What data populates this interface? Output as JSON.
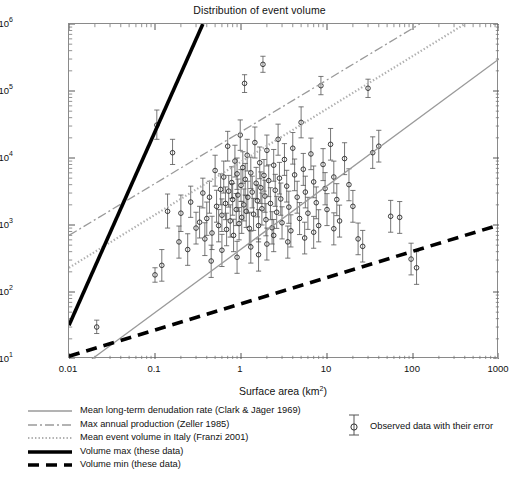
{
  "chart_data": {
    "type": "scatter",
    "title": "Distribution of event volume",
    "xlabel": "Surface area (km²)",
    "ylabel": "Event volume (m³)",
    "xscale": "log",
    "yscale": "log",
    "xlim": [
      0.01,
      1000
    ],
    "ylim": [
      10,
      1000000
    ],
    "grid": false,
    "xticks": [
      "0.01",
      "0.1",
      "1",
      "10",
      "100",
      "1000"
    ],
    "yticks": [
      "10^1",
      "10^2",
      "10^3",
      "10^4",
      "10^5",
      "10^6"
    ],
    "ytick_labels": [
      "10",
      "10",
      "10",
      "10",
      "10",
      "10"
    ],
    "ytick_exponents": [
      "1",
      "2",
      "3",
      "4",
      "5",
      "6"
    ],
    "legend_position": "below-axes",
    "series": [
      {
        "name": "Observed data with their error",
        "type": "scatter-errorbar",
        "marker": "open-circle",
        "color": "#303030",
        "points": [
          {
            "x": 0.021,
            "y": 30,
            "elo": 24,
            "ehi": 38
          },
          {
            "x": 0.1,
            "y": 180,
            "elo": 140,
            "ehi": 230
          },
          {
            "x": 0.105,
            "y": 31000,
            "elo": 19000,
            "ehi": 52000
          },
          {
            "x": 0.14,
            "y": 1600,
            "elo": 900,
            "ehi": 2900
          },
          {
            "x": 0.16,
            "y": 12000,
            "elo": 8000,
            "ehi": 19000
          },
          {
            "x": 0.2,
            "y": 1500,
            "elo": 800,
            "ehi": 2800
          },
          {
            "x": 0.26,
            "y": 2200,
            "elo": 1300,
            "ehi": 3800
          },
          {
            "x": 0.3,
            "y": 900,
            "elo": 520,
            "ehi": 1550
          },
          {
            "x": 0.33,
            "y": 1100,
            "elo": 640,
            "ehi": 1900
          },
          {
            "x": 0.36,
            "y": 3000,
            "elo": 1800,
            "ehi": 5000
          },
          {
            "x": 0.4,
            "y": 1250,
            "elo": 700,
            "ehi": 2200
          },
          {
            "x": 0.43,
            "y": 2600,
            "elo": 1500,
            "ehi": 4500
          },
          {
            "x": 0.46,
            "y": 760,
            "elo": 430,
            "ehi": 1350
          },
          {
            "x": 0.5,
            "y": 6500,
            "elo": 3800,
            "ehi": 11000
          },
          {
            "x": 0.52,
            "y": 1900,
            "elo": 1100,
            "ehi": 3300
          },
          {
            "x": 0.55,
            "y": 980,
            "elo": 560,
            "ehi": 1700
          },
          {
            "x": 0.58,
            "y": 3400,
            "elo": 2000,
            "ehi": 5800
          },
          {
            "x": 0.6,
            "y": 1400,
            "elo": 800,
            "ehi": 2450
          },
          {
            "x": 0.63,
            "y": 5200,
            "elo": 3000,
            "ehi": 9000
          },
          {
            "x": 0.66,
            "y": 2100,
            "elo": 1200,
            "ehi": 3700
          },
          {
            "x": 0.68,
            "y": 860,
            "elo": 490,
            "ehi": 1500
          },
          {
            "x": 0.7,
            "y": 15000,
            "elo": 9000,
            "ehi": 25000
          },
          {
            "x": 0.72,
            "y": 3200,
            "elo": 1850,
            "ehi": 5500
          },
          {
            "x": 0.75,
            "y": 1150,
            "elo": 660,
            "ehi": 2000
          },
          {
            "x": 0.78,
            "y": 4300,
            "elo": 2500,
            "ehi": 7400
          },
          {
            "x": 0.8,
            "y": 2400,
            "elo": 1400,
            "ehi": 4150
          },
          {
            "x": 0.82,
            "y": 700,
            "elo": 400,
            "ehi": 1220
          },
          {
            "x": 0.85,
            "y": 9000,
            "elo": 5200,
            "ehi": 15500
          },
          {
            "x": 0.88,
            "y": 1700,
            "elo": 980,
            "ehi": 2950
          },
          {
            "x": 0.9,
            "y": 5800,
            "elo": 3400,
            "ehi": 10000
          },
          {
            "x": 0.92,
            "y": 2800,
            "elo": 1600,
            "ehi": 4850
          },
          {
            "x": 0.95,
            "y": 1050,
            "elo": 600,
            "ehi": 1820
          },
          {
            "x": 0.98,
            "y": 22000,
            "elo": 13000,
            "ehi": 37000
          },
          {
            "x": 1.0,
            "y": 3900,
            "elo": 2250,
            "ehi": 6700
          },
          {
            "x": 1.02,
            "y": 1300,
            "elo": 750,
            "ehi": 2250
          },
          {
            "x": 1.05,
            "y": 7200,
            "elo": 4200,
            "ehi": 12400
          },
          {
            "x": 1.08,
            "y": 2000,
            "elo": 1150,
            "ehi": 3450
          },
          {
            "x": 1.1,
            "y": 130000,
            "elo": 95000,
            "ehi": 175000
          },
          {
            "x": 1.12,
            "y": 4800,
            "elo": 2800,
            "ehi": 8300
          },
          {
            "x": 1.15,
            "y": 1600,
            "elo": 920,
            "ehi": 2750
          },
          {
            "x": 1.18,
            "y": 11000,
            "elo": 6400,
            "ehi": 19000
          },
          {
            "x": 1.2,
            "y": 2600,
            "elo": 1500,
            "ehi": 4500
          },
          {
            "x": 1.25,
            "y": 890,
            "elo": 510,
            "ehi": 1550
          },
          {
            "x": 1.3,
            "y": 6000,
            "elo": 3500,
            "ehi": 10300
          },
          {
            "x": 1.35,
            "y": 3100,
            "elo": 1800,
            "ehi": 5350
          },
          {
            "x": 1.4,
            "y": 1450,
            "elo": 830,
            "ehi": 2500
          },
          {
            "x": 1.45,
            "y": 17000,
            "elo": 10000,
            "ehi": 29000
          },
          {
            "x": 1.5,
            "y": 4200,
            "elo": 2450,
            "ehi": 7250
          },
          {
            "x": 1.55,
            "y": 2300,
            "elo": 1320,
            "ehi": 3950
          },
          {
            "x": 1.6,
            "y": 980,
            "elo": 560,
            "ehi": 1700
          },
          {
            "x": 1.65,
            "y": 8500,
            "elo": 4900,
            "ehi": 14600
          },
          {
            "x": 1.7,
            "y": 3600,
            "elo": 2100,
            "ehi": 6200
          },
          {
            "x": 1.75,
            "y": 1750,
            "elo": 1000,
            "ehi": 3000
          },
          {
            "x": 1.8,
            "y": 250000,
            "elo": 190000,
            "ehi": 330000
          },
          {
            "x": 1.85,
            "y": 5500,
            "elo": 3200,
            "ehi": 9500
          },
          {
            "x": 1.9,
            "y": 2700,
            "elo": 1550,
            "ehi": 4650
          },
          {
            "x": 1.95,
            "y": 1200,
            "elo": 690,
            "ehi": 2080
          },
          {
            "x": 2.0,
            "y": 13000,
            "elo": 7600,
            "ehi": 22000
          },
          {
            "x": 2.1,
            "y": 4600,
            "elo": 2650,
            "ehi": 7900
          },
          {
            "x": 2.2,
            "y": 2100,
            "elo": 1200,
            "ehi": 3600
          },
          {
            "x": 2.3,
            "y": 910,
            "elo": 520,
            "ehi": 1580
          },
          {
            "x": 2.4,
            "y": 7800,
            "elo": 4500,
            "ehi": 13400
          },
          {
            "x": 2.5,
            "y": 3300,
            "elo": 1900,
            "ehi": 5700
          },
          {
            "x": 2.6,
            "y": 1550,
            "elo": 890,
            "ehi": 2680
          },
          {
            "x": 2.7,
            "y": 19000,
            "elo": 11000,
            "ehi": 32000
          },
          {
            "x": 2.8,
            "y": 5000,
            "elo": 2900,
            "ehi": 8600
          },
          {
            "x": 2.9,
            "y": 2450,
            "elo": 1400,
            "ehi": 4230
          },
          {
            "x": 3.0,
            "y": 1080,
            "elo": 620,
            "ehi": 1870
          },
          {
            "x": 3.2,
            "y": 9500,
            "elo": 5500,
            "ehi": 16400
          },
          {
            "x": 3.4,
            "y": 3800,
            "elo": 2200,
            "ehi": 6550
          },
          {
            "x": 3.6,
            "y": 1850,
            "elo": 1060,
            "ehi": 3200
          },
          {
            "x": 3.8,
            "y": 820,
            "elo": 470,
            "ehi": 1420
          },
          {
            "x": 4.0,
            "y": 14000,
            "elo": 8100,
            "ehi": 24000
          },
          {
            "x": 4.2,
            "y": 5600,
            "elo": 3250,
            "ehi": 9650
          },
          {
            "x": 4.5,
            "y": 2600,
            "elo": 1500,
            "ehi": 4500
          },
          {
            "x": 4.8,
            "y": 1250,
            "elo": 720,
            "ehi": 2160
          },
          {
            "x": 5.0,
            "y": 34000,
            "elo": 20000,
            "ehi": 58000
          },
          {
            "x": 5.3,
            "y": 6800,
            "elo": 3900,
            "ehi": 11700
          },
          {
            "x": 5.6,
            "y": 3100,
            "elo": 1800,
            "ehi": 5350
          },
          {
            "x": 6.0,
            "y": 1500,
            "elo": 860,
            "ehi": 2590
          },
          {
            "x": 6.5,
            "y": 11500,
            "elo": 6700,
            "ehi": 19800
          },
          {
            "x": 7.0,
            "y": 4400,
            "elo": 2550,
            "ehi": 7600
          },
          {
            "x": 7.5,
            "y": 2150,
            "elo": 1240,
            "ehi": 3700
          },
          {
            "x": 8.0,
            "y": 980,
            "elo": 560,
            "ehi": 1690
          },
          {
            "x": 8.5,
            "y": 120000,
            "elo": 88000,
            "ehi": 165000
          },
          {
            "x": 9.0,
            "y": 8000,
            "elo": 4600,
            "ehi": 13800
          },
          {
            "x": 9.5,
            "y": 3500,
            "elo": 2000,
            "ehi": 6050
          },
          {
            "x": 10.0,
            "y": 1700,
            "elo": 980,
            "ehi": 2940
          },
          {
            "x": 11.0,
            "y": 16000,
            "elo": 9300,
            "ehi": 27600
          },
          {
            "x": 12.0,
            "y": 5200,
            "elo": 3000,
            "ehi": 8980
          },
          {
            "x": 13.0,
            "y": 2400,
            "elo": 1380,
            "ehi": 4140
          },
          {
            "x": 14.0,
            "y": 1150,
            "elo": 660,
            "ehi": 1980
          },
          {
            "x": 16.0,
            "y": 9800,
            "elo": 5650,
            "ehi": 16900
          },
          {
            "x": 18.0,
            "y": 4000,
            "elo": 2300,
            "ehi": 6900
          },
          {
            "x": 20.0,
            "y": 1900,
            "elo": 1100,
            "ehi": 3280
          },
          {
            "x": 23.0,
            "y": 620,
            "elo": 360,
            "ehi": 1070
          },
          {
            "x": 26.0,
            "y": 480,
            "elo": 280,
            "ehi": 830
          },
          {
            "x": 30.0,
            "y": 110000,
            "elo": 80000,
            "ehi": 150000
          },
          {
            "x": 34.0,
            "y": 12000,
            "elo": 7000,
            "ehi": 20700
          },
          {
            "x": 40.0,
            "y": 15000,
            "elo": 8700,
            "ehi": 25900
          },
          {
            "x": 55.0,
            "y": 1350,
            "elo": 780,
            "ehi": 2330
          },
          {
            "x": 70.0,
            "y": 1300,
            "elo": 750,
            "ehi": 2240
          },
          {
            "x": 95.0,
            "y": 310,
            "elo": 180,
            "ehi": 535
          },
          {
            "x": 110.0,
            "y": 230,
            "elo": 130,
            "ehi": 400
          },
          {
            "x": 0.38,
            "y": 620,
            "elo": 350,
            "ehi": 1080
          },
          {
            "x": 0.24,
            "y": 430,
            "elo": 250,
            "ehi": 740
          },
          {
            "x": 0.12,
            "y": 250,
            "elo": 145,
            "ehi": 430
          },
          {
            "x": 0.6,
            "y": 420,
            "elo": 240,
            "ehi": 725
          },
          {
            "x": 1.3,
            "y": 470,
            "elo": 270,
            "ehi": 810
          },
          {
            "x": 2.0,
            "y": 520,
            "elo": 300,
            "ehi": 900
          },
          {
            "x": 3.5,
            "y": 560,
            "elo": 320,
            "ehi": 965
          },
          {
            "x": 5.5,
            "y": 640,
            "elo": 370,
            "ehi": 1100
          },
          {
            "x": 0.9,
            "y": 330,
            "elo": 190,
            "ehi": 570
          },
          {
            "x": 1.6,
            "y": 360,
            "elo": 205,
            "ehi": 620
          },
          {
            "x": 0.45,
            "y": 290,
            "elo": 165,
            "ehi": 500
          },
          {
            "x": 2.4,
            "y": 700,
            "elo": 400,
            "ehi": 1210
          },
          {
            "x": 7.0,
            "y": 780,
            "elo": 450,
            "ehi": 1345
          },
          {
            "x": 0.19,
            "y": 560,
            "elo": 320,
            "ehi": 965
          },
          {
            "x": 12.0,
            "y": 880,
            "elo": 505,
            "ehi": 1520
          }
        ]
      }
    ],
    "reference_lines": [
      {
        "name": "Mean long-term denudation rate (Clark & Jäger 1969)",
        "style": "solid",
        "color": "#9a9a9a",
        "width": 1.3,
        "points": [
          [
            0.0185,
            10
          ],
          [
            1000,
            300000
          ]
        ]
      },
      {
        "name": "Max annual production (Zeller 1985)",
        "style": "dashdot",
        "color": "#9a9a9a",
        "width": 1.3,
        "points": [
          [
            0.01,
            700
          ],
          [
            120,
            1000000
          ]
        ]
      },
      {
        "name": "Mean event volume in Italy (Franzi 2001)",
        "style": "dotted",
        "color": "#b0b0b0",
        "width": 2.2,
        "points": [
          [
            0.01,
            230
          ],
          [
            400,
            1000000
          ]
        ]
      },
      {
        "name": "Volume max (these data)",
        "style": "solid-thick",
        "color": "#000000",
        "width": 3.6,
        "points": [
          [
            0.01,
            32
          ],
          [
            0.36,
            1000000
          ]
        ]
      },
      {
        "name": "Volume min (these data)",
        "style": "dashed-thick",
        "color": "#000000",
        "width": 3.6,
        "points": [
          [
            0.01,
            11
          ],
          [
            1000,
            1000
          ]
        ]
      }
    ]
  },
  "legend": {
    "entries": [
      {
        "label": "Mean long-term denudation rate (Clark & Jäger  1969)",
        "style": "solid"
      },
      {
        "label": "Max annual production (Zeller 1985)",
        "style": "dashdot"
      },
      {
        "label": "Mean event volume in Italy (Franzi 2001)",
        "style": "dotted"
      },
      {
        "label": "Volume max (these data)",
        "style": "solid-thick"
      },
      {
        "label": "Volume min (these data)",
        "style": "dashed-thick"
      }
    ],
    "observed": {
      "label": "Observed data with their error"
    }
  },
  "axis_text": {
    "y_base": "10",
    "x_unit": "Surface area (km",
    "x_unit_sup": "2",
    "x_unit_end": ")",
    "y_unit": "Event volume (m",
    "y_unit_sup": "3",
    "y_unit_end": ")"
  }
}
